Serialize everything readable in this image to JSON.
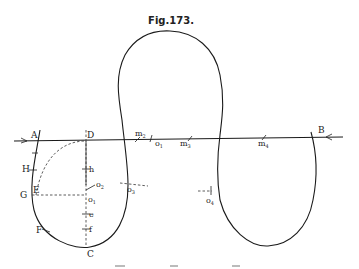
{
  "figure": {
    "title": "Fig.173.",
    "labels": {
      "A": "A",
      "B": "B",
      "C": "C",
      "D": "D",
      "E": "E",
      "F": "F",
      "G": "G",
      "H": "H",
      "h": "h",
      "e": "e",
      "f": "f",
      "o1": "o",
      "o1_sub": "1",
      "o2": "o",
      "o2_sub": "2",
      "o3": "o",
      "o3_sub": "3",
      "o4": "o",
      "o4_sub": "4",
      "o1b": "o",
      "o1b_sub": "1",
      "m2": "m",
      "m2_sub": "2",
      "m3": "m",
      "m3_sub": "3",
      "m4": "m",
      "m4_sub": "4"
    }
  }
}
